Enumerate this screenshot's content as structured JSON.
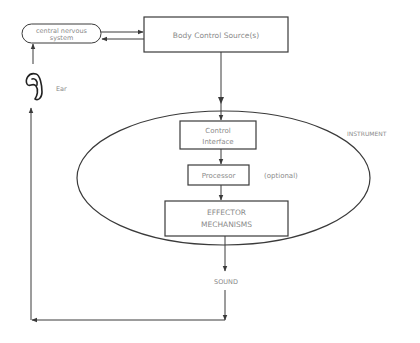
{
  "diagram": {
    "nodes": {
      "cns": {
        "line1": "central nervous",
        "line2": "system"
      },
      "body_control": {
        "label": "Body Control Source(s)"
      },
      "ear": {
        "label": "Ear"
      },
      "instrument": {
        "label": "INSTRUMENT"
      },
      "control_interface": {
        "line1": "Control",
        "line2": "Interface"
      },
      "processor": {
        "label": "Processor",
        "note": "(optional)"
      },
      "effector": {
        "line1": "EFFECTOR",
        "line2": "MECHANISMS"
      },
      "sound": {
        "label": "SOUND"
      }
    },
    "edges": [
      {
        "from": "cns",
        "to": "body_control"
      },
      {
        "from": "body_control",
        "to": "cns"
      },
      {
        "from": "body_control",
        "to": "control_interface"
      },
      {
        "from": "control_interface",
        "to": "processor"
      },
      {
        "from": "processor",
        "to": "effector"
      },
      {
        "from": "effector",
        "to": "sound"
      },
      {
        "from": "sound",
        "to": "ear"
      },
      {
        "from": "ear",
        "to": "cns"
      }
    ],
    "colors": {
      "line": "#3a3a3a",
      "text": "#8a8a8a",
      "background": "#ffffff"
    }
  }
}
